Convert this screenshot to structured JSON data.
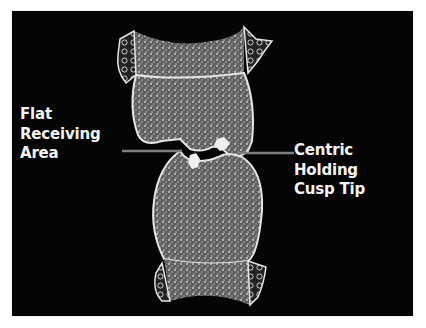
{
  "slide": {
    "background_color": "#050505",
    "labels": {
      "left": [
        "Flat",
        "Receiving",
        "Area"
      ],
      "right": [
        "Centric Holding",
        "Cusp Tip"
      ]
    },
    "illustration": {
      "subject": "cross-section of upper and lower teeth in occlusion",
      "indicator_lines": [
        "flat-receiving-area-line",
        "centric-holding-cusp-tip-line"
      ],
      "line_color": "#808080",
      "outline_color": "#e6e6e6",
      "fill_color": "#6a6a6a"
    }
  }
}
